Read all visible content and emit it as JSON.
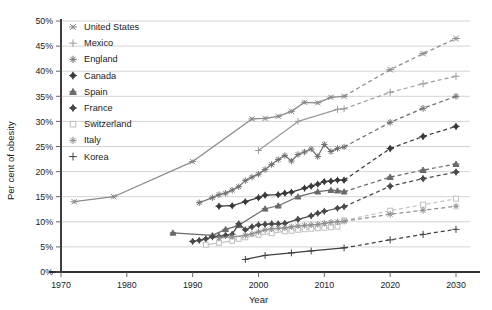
{
  "chart_data": {
    "type": "line",
    "title": "",
    "xlabel": "Year",
    "ylabel": "Per cent of obesity",
    "xlim": [
      1970,
      2030
    ],
    "ylim": [
      0,
      0.5
    ],
    "xticks": [
      "1970",
      "1980",
      "1990",
      "2000",
      "2010",
      "2020",
      "2030"
    ],
    "xtick_values": [
      1970,
      1980,
      1990,
      2000,
      2010,
      2020,
      2030
    ],
    "yticks": [
      "0%",
      "5%",
      "10%",
      "15%",
      "20%",
      "25%",
      "30%",
      "35%",
      "40%",
      "45%",
      "50%"
    ],
    "ytick_values": [
      0,
      5,
      10,
      15,
      20,
      25,
      30,
      35,
      40,
      45,
      50
    ],
    "grid": true,
    "grid_axis": "y",
    "legend_position": "top-left",
    "projection_note": "Solid lines are observed data; dashed lines are projections beyond ~2013",
    "series": [
      {
        "name": "United States",
        "color": "#8a8a8a",
        "marker": "x-star",
        "observed": [
          [
            1972,
            14.0
          ],
          [
            1978,
            15.0
          ],
          [
            1990,
            22.0
          ],
          [
            1999,
            30.5
          ],
          [
            2001,
            30.6
          ],
          [
            2003,
            31.0
          ],
          [
            2005,
            32.0
          ],
          [
            2007,
            33.8
          ],
          [
            2009,
            33.7
          ],
          [
            2011,
            34.8
          ],
          [
            2013,
            35.0
          ]
        ],
        "projected": [
          [
            2013,
            35.0
          ],
          [
            2020,
            40.3
          ],
          [
            2025,
            43.5
          ],
          [
            2030,
            46.5
          ]
        ]
      },
      {
        "name": "Mexico",
        "color": "#9a9a9a",
        "marker": "plus",
        "observed": [
          [
            2000,
            24.2
          ],
          [
            2006,
            30.0
          ],
          [
            2012,
            32.4
          ],
          [
            2013,
            32.5
          ]
        ],
        "projected": [
          [
            2013,
            32.5
          ],
          [
            2020,
            35.8
          ],
          [
            2025,
            37.5
          ],
          [
            2030,
            39.0
          ]
        ]
      },
      {
        "name": "England",
        "color": "#707070",
        "marker": "asterisk",
        "observed": [
          [
            1991,
            13.8
          ],
          [
            1993,
            14.8
          ],
          [
            1994,
            15.4
          ],
          [
            1995,
            15.7
          ],
          [
            1996,
            16.3
          ],
          [
            1997,
            17.0
          ],
          [
            1998,
            18.2
          ],
          [
            1999,
            18.9
          ],
          [
            2000,
            19.5
          ],
          [
            2001,
            20.4
          ],
          [
            2002,
            21.4
          ],
          [
            2003,
            22.4
          ],
          [
            2004,
            23.2
          ],
          [
            2005,
            22.1
          ],
          [
            2006,
            23.4
          ],
          [
            2007,
            23.9
          ],
          [
            2008,
            24.5
          ],
          [
            2009,
            23.0
          ],
          [
            2010,
            25.4
          ],
          [
            2011,
            24.0
          ],
          [
            2012,
            24.6
          ],
          [
            2013,
            24.9
          ]
        ],
        "projected": [
          [
            2013,
            24.9
          ],
          [
            2020,
            29.8
          ],
          [
            2025,
            32.6
          ],
          [
            2030,
            35.0
          ]
        ]
      },
      {
        "name": "Canada",
        "color": "#3a3a3a",
        "marker": "diamond",
        "observed": [
          [
            1994,
            13.1
          ],
          [
            1996,
            13.2
          ],
          [
            1998,
            14.0
          ],
          [
            2000,
            14.8
          ],
          [
            2001,
            15.3
          ],
          [
            2003,
            15.4
          ],
          [
            2004,
            15.7
          ],
          [
            2005,
            15.9
          ],
          [
            2007,
            16.7
          ],
          [
            2008,
            17.1
          ],
          [
            2009,
            17.5
          ],
          [
            2010,
            18.0
          ],
          [
            2011,
            18.1
          ],
          [
            2012,
            18.3
          ],
          [
            2013,
            18.3
          ]
        ],
        "projected": [
          [
            2013,
            18.3
          ],
          [
            2020,
            24.6
          ],
          [
            2025,
            27.0
          ],
          [
            2030,
            29.0
          ]
        ]
      },
      {
        "name": "Spain",
        "color": "#6a6a6a",
        "marker": "triangle",
        "observed": [
          [
            1987,
            7.8
          ],
          [
            1993,
            7.3
          ],
          [
            1995,
            8.5
          ],
          [
            1997,
            9.3
          ],
          [
            2001,
            12.6
          ],
          [
            2003,
            13.2
          ],
          [
            2006,
            15.0
          ],
          [
            2009,
            16.0
          ],
          [
            2011,
            16.3
          ],
          [
            2012,
            16.2
          ],
          [
            2013,
            16.0
          ]
        ],
        "projected": [
          [
            2013,
            16.0
          ],
          [
            2020,
            18.9
          ],
          [
            2025,
            20.3
          ],
          [
            2030,
            21.5
          ]
        ]
      },
      {
        "name": "France",
        "color": "#4a4a4a",
        "marker": "diamond",
        "observed": [
          [
            1990,
            6.1
          ],
          [
            1991,
            6.3
          ],
          [
            1992,
            6.6
          ],
          [
            1993,
            7.0
          ],
          [
            1994,
            7.1
          ],
          [
            1995,
            7.3
          ],
          [
            1996,
            7.5
          ],
          [
            1997,
            9.6
          ],
          [
            1998,
            8.4
          ],
          [
            1999,
            9.0
          ],
          [
            2000,
            9.4
          ],
          [
            2001,
            9.5
          ],
          [
            2002,
            9.6
          ],
          [
            2003,
            9.6
          ],
          [
            2004,
            9.7
          ],
          [
            2006,
            10.5
          ],
          [
            2008,
            11.2
          ],
          [
            2009,
            11.7
          ],
          [
            2010,
            12.1
          ],
          [
            2012,
            12.7
          ],
          [
            2013,
            13.0
          ]
        ],
        "projected": [
          [
            2013,
            13.0
          ],
          [
            2020,
            17.1
          ],
          [
            2025,
            18.6
          ],
          [
            2030,
            19.9
          ]
        ]
      },
      {
        "name": "Switzerland",
        "color": "#c4c4c4",
        "marker": "square",
        "observed": [
          [
            1992,
            5.4
          ],
          [
            1994,
            5.8
          ],
          [
            1996,
            6.2
          ],
          [
            1997,
            6.6
          ],
          [
            1998,
            6.9
          ],
          [
            2000,
            7.4
          ],
          [
            2002,
            7.7
          ],
          [
            2004,
            8.1
          ],
          [
            2005,
            8.2
          ],
          [
            2006,
            8.4
          ],
          [
            2007,
            8.5
          ],
          [
            2008,
            8.6
          ],
          [
            2009,
            8.7
          ],
          [
            2010,
            8.8
          ],
          [
            2011,
            8.9
          ],
          [
            2012,
            9.0
          ],
          [
            2013,
            10.3
          ]
        ],
        "projected": [
          [
            2013,
            10.3
          ],
          [
            2020,
            12.2
          ],
          [
            2025,
            13.4
          ],
          [
            2030,
            14.6
          ]
        ]
      },
      {
        "name": "Italy",
        "color": "#8e8e8e",
        "marker": "asterisk",
        "observed": [
          [
            1994,
            6.8
          ],
          [
            1996,
            7.0
          ],
          [
            1998,
            7.3
          ],
          [
            1999,
            7.6
          ],
          [
            2000,
            8.0
          ],
          [
            2001,
            8.4
          ],
          [
            2002,
            8.6
          ],
          [
            2003,
            8.7
          ],
          [
            2004,
            8.8
          ],
          [
            2005,
            9.0
          ],
          [
            2006,
            9.2
          ],
          [
            2007,
            9.3
          ],
          [
            2008,
            9.4
          ],
          [
            2009,
            9.5
          ],
          [
            2010,
            9.7
          ],
          [
            2011,
            9.9
          ],
          [
            2012,
            10.0
          ],
          [
            2013,
            10.1
          ]
        ],
        "projected": [
          [
            2013,
            10.1
          ],
          [
            2020,
            11.5
          ],
          [
            2025,
            12.3
          ],
          [
            2030,
            13.1
          ]
        ]
      },
      {
        "name": "Korea",
        "color": "#404040",
        "marker": "plus",
        "observed": [
          [
            1998,
            2.5
          ],
          [
            2001,
            3.3
          ],
          [
            2005,
            3.8
          ],
          [
            2008,
            4.2
          ],
          [
            2013,
            4.8
          ]
        ],
        "projected": [
          [
            2013,
            4.8
          ],
          [
            2020,
            6.4
          ],
          [
            2025,
            7.5
          ],
          [
            2030,
            8.5
          ]
        ]
      }
    ]
  },
  "legend": {
    "items": [
      {
        "label": "United States"
      },
      {
        "label": "Mexico"
      },
      {
        "label": "England"
      },
      {
        "label": "Canada"
      },
      {
        "label": "Spain"
      },
      {
        "label": "France"
      },
      {
        "label": "Switzerland"
      },
      {
        "label": "Italy"
      },
      {
        "label": "Korea"
      }
    ]
  }
}
